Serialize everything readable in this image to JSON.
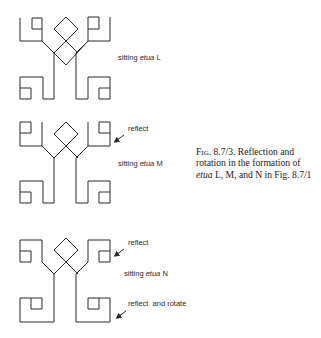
{
  "figures": [
    {
      "id": "L",
      "label_prefix": "sitting ",
      "label_term": "etua",
      "label_suffix": " L",
      "annotations": []
    },
    {
      "id": "M",
      "label_prefix": "sitting ",
      "label_term": "etua",
      "label_suffix": " M",
      "annotations": [
        "reflect"
      ]
    },
    {
      "id": "N",
      "label_prefix": "sitting ",
      "label_term": "etua",
      "label_suffix": " N",
      "annotations": [
        "reflect",
        "reflect  and rotate"
      ]
    }
  ],
  "caption": {
    "fig_label": "Fig.",
    "fig_number": " 8.7/3.",
    "text_1": "  Reflection and rotation in the formation of ",
    "term": "etua",
    "text_2": " L, M, and N in Fig. 8.7/1"
  },
  "colors": {
    "ink": "#2a2a2a",
    "background": "#ffffff"
  }
}
